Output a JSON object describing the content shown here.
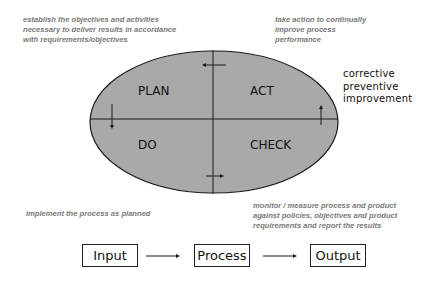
{
  "diagram": {
    "quadrants": [
      {
        "id": "plan",
        "label": "PLAN",
        "description": "establish the objectives and activities\nnecessary to deliver results in accordance\nwith requirements/objectives"
      },
      {
        "id": "act",
        "label": "ACT",
        "description": "take action to continually\nimprove process\nperformance"
      },
      {
        "id": "do",
        "label": "DO",
        "description": "implement the process as planned"
      },
      {
        "id": "check",
        "label": "CHECK",
        "description": "monitor / measure process and product\nagainst policies, objectives and product\nrequirements and report the results"
      }
    ],
    "act_side_note": "corrective\npreventive\nimprovement",
    "flow": [
      {
        "label": "Input"
      },
      {
        "label": "Process"
      },
      {
        "label": "Output"
      }
    ],
    "colors": {
      "ellipse_fill": "#a9a9a9",
      "stroke": "#1a1a1a",
      "note_text": "#7a7a7a"
    }
  }
}
